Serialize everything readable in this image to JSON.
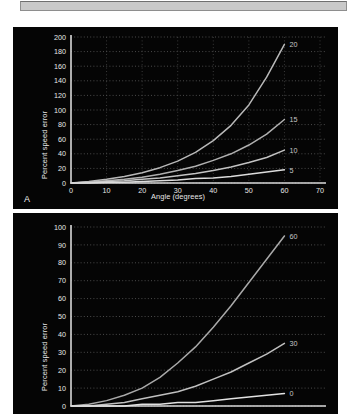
{
  "toolbar": {
    "name": "document-toolbar"
  },
  "figure": {
    "panels": [
      {
        "letter": "A",
        "name": "panel-a"
      },
      {
        "letter": "",
        "name": "panel-b"
      }
    ]
  },
  "chart_data": [
    {
      "type": "line",
      "panel": "A",
      "title": "",
      "xlabel": "Angle (degrees)",
      "ylabel": "Percent speed error",
      "xlim": [
        0,
        70
      ],
      "ylim": [
        0,
        200
      ],
      "xticks": [
        0,
        10,
        20,
        30,
        40,
        50,
        60,
        70
      ],
      "yticks": [
        0,
        20,
        40,
        60,
        80,
        100,
        120,
        140,
        160,
        180,
        200
      ],
      "grid": true,
      "grid_style": "dotted",
      "legend": "inline-end-labels",
      "background": "#050505",
      "axis_color": "#d8d8d8",
      "x": [
        0,
        5,
        10,
        15,
        20,
        25,
        30,
        35,
        40,
        45,
        50,
        55,
        60
      ],
      "series": [
        {
          "name": "20",
          "label": "20",
          "color": "#b9b9b9",
          "values": [
            0,
            2,
            5,
            9,
            14,
            21,
            30,
            42,
            58,
            79,
            107,
            145,
            190
          ]
        },
        {
          "name": "15",
          "label": "15",
          "color": "#b0b0b0",
          "values": [
            0,
            1,
            3,
            5,
            8,
            12,
            17,
            23,
            31,
            40,
            52,
            67,
            87
          ]
        },
        {
          "name": "10",
          "label": "10",
          "color": "#c3c3c3",
          "values": [
            0,
            1,
            2,
            3,
            5,
            7,
            10,
            13,
            17,
            22,
            28,
            35,
            45
          ]
        },
        {
          "name": "5",
          "label": "5",
          "color": "#dcdcdc",
          "values": [
            0,
            0,
            1,
            1,
            2,
            3,
            4,
            6,
            7,
            9,
            12,
            15,
            18
          ]
        }
      ]
    },
    {
      "type": "line",
      "panel": "B",
      "title": "",
      "xlabel": "",
      "ylabel": "Percent speed error",
      "xlim": [
        0,
        70
      ],
      "ylim": [
        0,
        100
      ],
      "xticks": [],
      "yticks": [
        0,
        10,
        20,
        30,
        40,
        50,
        60,
        70,
        80,
        90,
        100
      ],
      "grid": true,
      "grid_style": "dotted",
      "legend": "inline-end-labels",
      "background": "#050505",
      "axis_color": "#d8d8d8",
      "cropped": true,
      "x": [
        0,
        5,
        10,
        15,
        20,
        25,
        30,
        35,
        40,
        45,
        50,
        55,
        60
      ],
      "series": [
        {
          "name": "60",
          "label": "60",
          "color": "#a9a9a9",
          "values": [
            0,
            1,
            3,
            6,
            10,
            16,
            24,
            33,
            44,
            56,
            69,
            82,
            95
          ]
        },
        {
          "name": "30",
          "label": "30",
          "color": "#c0c0c0",
          "values": [
            0,
            0,
            1,
            2,
            4,
            6,
            8,
            11,
            15,
            19,
            24,
            29,
            35
          ]
        },
        {
          "name": "0",
          "label": "0",
          "color": "#e2e2e2",
          "values": [
            0,
            0,
            0,
            0,
            1,
            1,
            2,
            2,
            3,
            4,
            5,
            6,
            7
          ]
        }
      ]
    }
  ]
}
